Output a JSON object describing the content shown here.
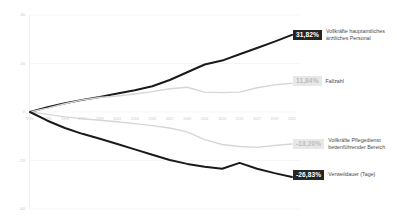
{
  "chart_data": {
    "type": "line",
    "title": "",
    "xlabel": "",
    "ylabel": "",
    "ylim": [
      -40,
      40
    ],
    "grid": true,
    "legend_position": "right-inline-endlabels",
    "yticks": [
      "40",
      "20",
      "0",
      "-20",
      "-40"
    ],
    "ytick_values": [
      40,
      20,
      0,
      -20,
      -40
    ],
    "categories": [
      "1991",
      "1993",
      "1995",
      "1997",
      "1999",
      "2001",
      "2003",
      "2005",
      "2007",
      "2009",
      "2011",
      "2013",
      "2015",
      "2017",
      "2019",
      "2021"
    ],
    "series": [
      {
        "name": "Vollkräfte hauptamtliches\närztliches Personal",
        "end_value_label": "31,82%",
        "end_value": 31.82,
        "color": "#1a1a1a",
        "badge_style": "dark",
        "values": [
          0,
          2.0,
          3.6,
          5.0,
          6.2,
          7.6,
          9.0,
          10.6,
          13.2,
          16.4,
          19.6,
          21.2,
          23.8,
          26.4,
          29.0,
          31.82
        ]
      },
      {
        "name": "Fallzahl",
        "end_value_label": "11,84%",
        "end_value": 11.84,
        "color": "#d6d6d6",
        "badge_style": "light",
        "values": [
          0,
          1.6,
          3.4,
          5.0,
          6.0,
          6.6,
          7.4,
          8.4,
          9.6,
          10.2,
          8.2,
          8.0,
          8.2,
          10.0,
          11.2,
          11.84
        ]
      },
      {
        "name": "Vollkräfte Pflegedienst\nbettenführender Bereich",
        "end_value_label": "-13,20%",
        "end_value": -13.2,
        "color": "#d6d6d6",
        "badge_style": "light",
        "values": [
          0,
          -1.0,
          -2.0,
          -2.8,
          -3.4,
          -4.0,
          -4.8,
          -5.6,
          -6.6,
          -8.2,
          -11.4,
          -13.4,
          -14.2,
          -14.6,
          -13.8,
          -13.2
        ]
      },
      {
        "name": "Verweildauer (Tage)",
        "end_value_label": "-26,83%",
        "end_value": -26.83,
        "color": "#1a1a1a",
        "badge_style": "dark",
        "values": [
          0,
          -3.6,
          -6.6,
          -9.0,
          -11.0,
          -13.2,
          -15.4,
          -17.6,
          -19.8,
          -21.4,
          -22.6,
          -23.4,
          -21.0,
          -23.4,
          -25.2,
          -26.83
        ]
      }
    ]
  }
}
